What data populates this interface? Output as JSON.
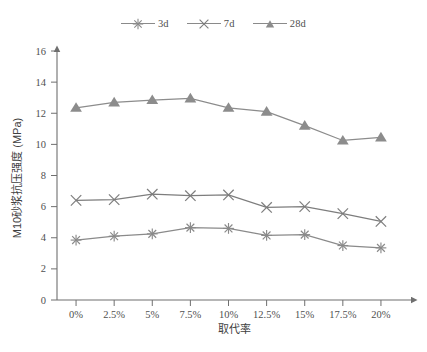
{
  "chart_data": {
    "type": "line",
    "title": "",
    "xlabel": "取代率",
    "ylabel": "M10砂浆抗压强度 (MPa)",
    "categories": [
      "0%",
      "2.5%",
      "5%",
      "7.5%",
      "10%",
      "12.5%",
      "15%",
      "17.5%",
      "20%"
    ],
    "ylim": [
      0,
      16
    ],
    "ytick_labels": [
      "0",
      "2",
      "4",
      "6",
      "8",
      "10",
      "12",
      "14",
      "16"
    ],
    "ytick_values": [
      0,
      2,
      4,
      6,
      8,
      10,
      12,
      14,
      16
    ],
    "grid": false,
    "legend_position": "top-center",
    "series": [
      {
        "name": "3d",
        "marker": "asterisk",
        "color": "#8a8a8a",
        "values": [
          3.85,
          4.1,
          4.25,
          4.65,
          4.6,
          4.15,
          4.2,
          3.5,
          3.35
        ]
      },
      {
        "name": "7d",
        "marker": "x-cross",
        "color": "#7d7d7d",
        "values": [
          6.4,
          6.45,
          6.8,
          6.7,
          6.75,
          5.95,
          6.0,
          5.55,
          5.05
        ]
      },
      {
        "name": "28d",
        "marker": "triangle",
        "color": "#8c8c8c",
        "values": [
          12.35,
          12.7,
          12.85,
          12.95,
          12.35,
          12.1,
          11.2,
          10.25,
          10.45
        ]
      }
    ]
  },
  "legend": {
    "items": [
      {
        "label": "3d",
        "marker": "asterisk-marker-icon"
      },
      {
        "label": "7d",
        "marker": "x-cross-marker-icon"
      },
      {
        "label": "28d",
        "marker": "triangle-marker-icon"
      }
    ]
  },
  "axes": {
    "x_title": "取代率",
    "y_title": "M10砂浆抗压强度 (MPa)"
  }
}
